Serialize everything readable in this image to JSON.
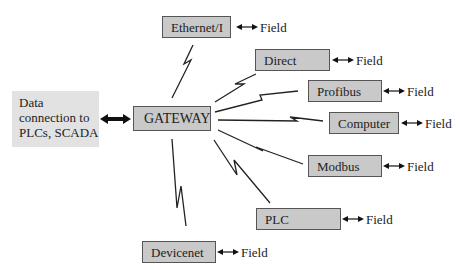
{
  "diagram": {
    "source": {
      "lines": [
        "Data",
        "connection to",
        "PLCs, SCADA"
      ]
    },
    "gateway": {
      "label": "GATEWAY"
    },
    "nodes": [
      {
        "id": "ethernet",
        "label": "Ethernet/I",
        "field_label": "Field"
      },
      {
        "id": "direct",
        "label": "Direct",
        "field_label": "Field"
      },
      {
        "id": "profibus",
        "label": "Profibus",
        "field_label": "Field"
      },
      {
        "id": "computer",
        "label": "Computer",
        "field_label": "Field"
      },
      {
        "id": "modbus",
        "label": "Modbus",
        "field_label": "Field"
      },
      {
        "id": "plc",
        "label": "PLC",
        "field_label": "Field"
      },
      {
        "id": "devicenet",
        "label": "Devicenet",
        "field_label": "Field"
      }
    ],
    "colors": {
      "box_fill": "#c9c9c9",
      "box_border": "#555555",
      "source_fill": "#e2e2e2",
      "line": "#222222"
    }
  }
}
